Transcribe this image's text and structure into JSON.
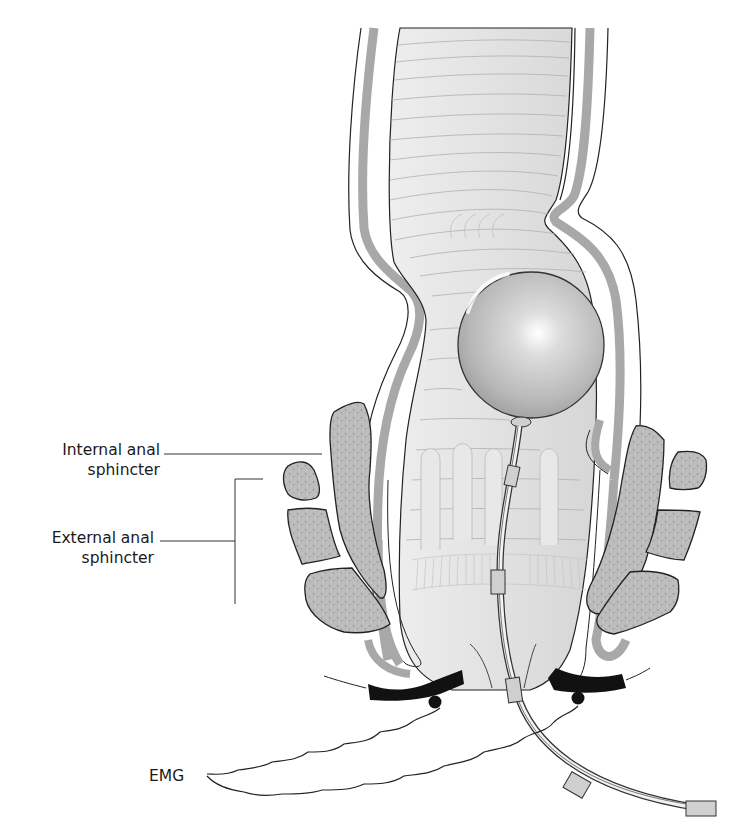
{
  "figure": {
    "type": "anatomical diagram",
    "labels": {
      "internal_anal_sphincter": [
        "Internal anal",
        "sphincter"
      ],
      "external_anal_sphincter": [
        "External anal",
        "sphincter"
      ],
      "emg": "EMG"
    },
    "elements": [
      "rectum",
      "rectal balloon",
      "catheter",
      "internal anal sphincter",
      "external anal sphincter muscle bundles",
      "perianal EMG electrodes",
      "EMG signal leads"
    ],
    "colors": {
      "wall_grey": "#a9a9a9",
      "lumen_grey": "#e6e6e6",
      "muscle_grey": "#bdbdbd",
      "electrode_black": "#111111",
      "outline": "#222222"
    }
  }
}
